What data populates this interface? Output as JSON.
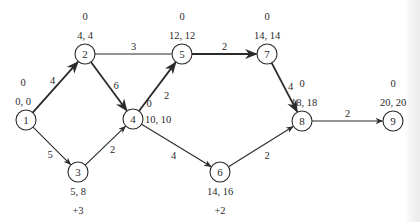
{
  "diagram": {
    "type": "activity-network",
    "nodes": [
      {
        "id": "1",
        "label": "1",
        "x": 26,
        "y": 120,
        "times": "0, 0",
        "slack": "0",
        "times_pos": "above",
        "slack_pos": "above"
      },
      {
        "id": "2",
        "label": "2",
        "x": 85,
        "y": 54,
        "times": "4, 4",
        "slack": "0",
        "times_pos": "above",
        "slack_pos": "above"
      },
      {
        "id": "3",
        "label": "3",
        "x": 78,
        "y": 172,
        "times": "5, 8",
        "slack": "+3",
        "times_pos": "below",
        "slack_pos": "below"
      },
      {
        "id": "4",
        "label": "4",
        "x": 133,
        "y": 119,
        "times": "10, 10",
        "slack": "0",
        "times_pos": "right",
        "slack_pos": "upper-right"
      },
      {
        "id": "5",
        "label": "5",
        "x": 182,
        "y": 54,
        "times": "12, 12",
        "slack": "0",
        "times_pos": "above",
        "slack_pos": "above"
      },
      {
        "id": "6",
        "label": "6",
        "x": 220,
        "y": 172,
        "times": "14, 16",
        "slack": "+2",
        "times_pos": "below",
        "slack_pos": "below"
      },
      {
        "id": "7",
        "label": "7",
        "x": 267,
        "y": 54,
        "times": "14, 14",
        "slack": "0",
        "times_pos": "above",
        "slack_pos": "above"
      },
      {
        "id": "8",
        "label": "8",
        "x": 302,
        "y": 121,
        "times": "18, 18",
        "slack": "0",
        "times_pos": "above",
        "slack_pos": "above"
      },
      {
        "id": "9",
        "label": "9",
        "x": 393,
        "y": 121,
        "times": "20, 20",
        "slack": "0",
        "times_pos": "above",
        "slack_pos": "above"
      }
    ],
    "edges": [
      {
        "from": "1",
        "to": "2",
        "weight": "4",
        "critical": true
      },
      {
        "from": "1",
        "to": "3",
        "weight": "5",
        "critical": false
      },
      {
        "from": "2",
        "to": "5",
        "weight": "3",
        "critical": false,
        "arrow": false
      },
      {
        "from": "2",
        "to": "4",
        "weight": "6",
        "critical": true
      },
      {
        "from": "3",
        "to": "4",
        "weight": "2",
        "critical": false
      },
      {
        "from": "4",
        "to": "5",
        "weight": "2",
        "critical": true
      },
      {
        "from": "4",
        "to": "6",
        "weight": "4",
        "critical": false
      },
      {
        "from": "5",
        "to": "7",
        "weight": "2",
        "critical": true
      },
      {
        "from": "6",
        "to": "8",
        "weight": "2",
        "critical": false
      },
      {
        "from": "7",
        "to": "8",
        "weight": "4",
        "critical": true
      },
      {
        "from": "8",
        "to": "9",
        "weight": "2",
        "critical": false
      }
    ]
  }
}
